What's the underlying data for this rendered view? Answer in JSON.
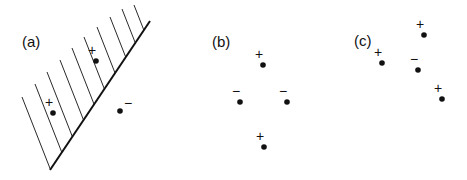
{
  "panels": [
    {
      "label": "(a)",
      "label_pos": [
        22,
        47
      ],
      "boundary": {
        "x1": 50,
        "y1": 170,
        "x2": 150,
        "y2": 21
      },
      "hatch_tops": [
        [
          22,
          97
        ],
        [
          35,
          84
        ],
        [
          47,
          72
        ],
        [
          60,
          60
        ],
        [
          72,
          48
        ],
        [
          84,
          37
        ],
        [
          97,
          27
        ],
        [
          110,
          17
        ],
        [
          122,
          9
        ],
        [
          134,
          5
        ]
      ],
      "points": [
        {
          "sign": "+",
          "x": 53,
          "y": 113
        },
        {
          "sign": "+",
          "x": 96,
          "y": 61
        },
        {
          "sign": "−",
          "x": 120,
          "y": 111
        }
      ]
    },
    {
      "label": "(b)",
      "label_pos": [
        212,
        47
      ],
      "points": [
        {
          "sign": "+",
          "x": 263,
          "y": 65
        },
        {
          "sign": "−",
          "x": 240,
          "y": 102
        },
        {
          "sign": "−",
          "x": 287,
          "y": 102
        },
        {
          "sign": "+",
          "x": 264,
          "y": 147
        }
      ]
    },
    {
      "label": "(c)",
      "label_pos": [
        354,
        46
      ],
      "points": [
        {
          "sign": "+",
          "x": 424,
          "y": 35
        },
        {
          "sign": "+",
          "x": 382,
          "y": 63
        },
        {
          "sign": "−",
          "x": 418,
          "y": 70
        },
        {
          "sign": "+",
          "x": 442,
          "y": 99
        }
      ]
    }
  ],
  "colors": {
    "ink": "#111111",
    "background": "#ffffff"
  }
}
